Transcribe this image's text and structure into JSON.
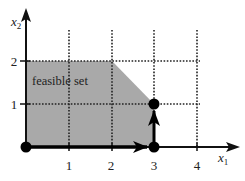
{
  "diagram": {
    "region_label": "feasible set",
    "axes": {
      "x_label": "x",
      "x_sub": "1",
      "y_label": "x",
      "y_sub": "2",
      "x_ticks": [
        "1",
        "2",
        "3",
        "4"
      ],
      "y_ticks": [
        "1",
        "2"
      ]
    },
    "feasible_region_vertices": [
      [
        0,
        0
      ],
      [
        0,
        2
      ],
      [
        2,
        2
      ],
      [
        3,
        1
      ],
      [
        3,
        0
      ]
    ],
    "path_points": [
      [
        0,
        0
      ],
      [
        3,
        0
      ],
      [
        3,
        1
      ]
    ],
    "colors": {
      "region_fill": "#a9a9a9",
      "axis": "#111111",
      "grid": "#222222",
      "background": "#ffffff"
    }
  }
}
